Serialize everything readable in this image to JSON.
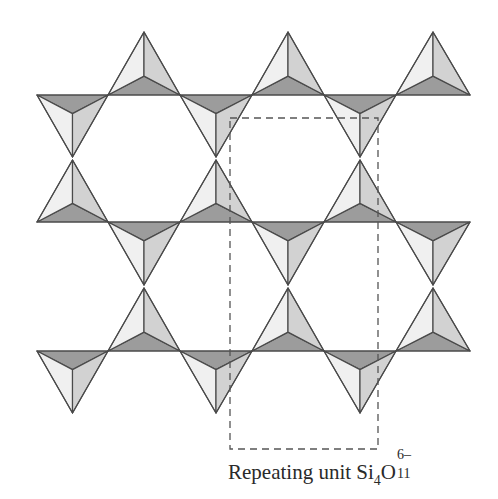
{
  "figure": {
    "type": "silicate double-chain (amphibole) tetrahedral network",
    "colors": {
      "edge": "#4a4a4a",
      "face_light": "#f0f0f0",
      "face_mid": "#d2d2d2",
      "face_dark": "#9c9c9c",
      "dashed_box": "#555555"
    },
    "rows": [
      {
        "line_y": 95,
        "up_apex_y": 32,
        "down_apex_y": 157,
        "up_first": false
      },
      {
        "line_y": 222,
        "up_apex_y": 160,
        "down_apex_y": 285,
        "up_first": true
      },
      {
        "line_y": 351,
        "up_apex_y": 288,
        "down_apex_y": 413,
        "up_first": false
      }
    ],
    "nodes_x": [
      37,
      108,
      180,
      252,
      324,
      396,
      470
    ],
    "repeat_box": {
      "x": 230,
      "y": 118,
      "width": 148,
      "height": 331
    }
  },
  "caption": {
    "text": "Repeating unit ",
    "formula": {
      "el1": "Si",
      "sub1": "4",
      "el2": "O",
      "sub2": "11",
      "charge": "6–"
    }
  }
}
